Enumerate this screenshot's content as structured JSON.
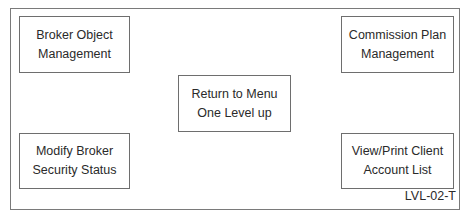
{
  "diagram": {
    "frame_label": "LVL-02-T",
    "boxes": [
      {
        "id": "broker-object-management",
        "lines": [
          "Broker Object",
          "Management"
        ]
      },
      {
        "id": "commission-plan-management",
        "lines": [
          "Commission Plan",
          "Management"
        ]
      },
      {
        "id": "return-to-menu",
        "lines": [
          "Return to Menu",
          "One Level up"
        ]
      },
      {
        "id": "modify-broker-security-status",
        "lines": [
          "Modify Broker",
          "Security Status"
        ]
      },
      {
        "id": "view-print-client-account-list",
        "lines": [
          "View/Print Client",
          "Account List"
        ]
      }
    ]
  }
}
